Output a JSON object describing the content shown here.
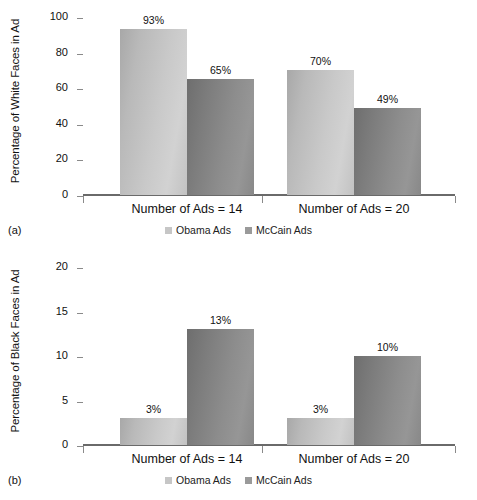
{
  "figure": {
    "panels": [
      {
        "caption": "(a)",
        "ylabel": "Percentage of White Faces in Ad",
        "yticks": [
          "0",
          "20",
          "40",
          "60",
          "80",
          "100"
        ],
        "groups": [
          {
            "label": "Number of Ads = 14",
            "bars": [
              {
                "series": "Obama Ads",
                "value": 93,
                "display": "93%"
              },
              {
                "series": "McCain Ads",
                "value": 65,
                "display": "65%"
              }
            ]
          },
          {
            "label": "Number of Ads = 20",
            "bars": [
              {
                "series": "Obama Ads",
                "value": 70,
                "display": "70%"
              },
              {
                "series": "McCain Ads",
                "value": 49,
                "display": "49%"
              }
            ]
          }
        ],
        "legend": [
          {
            "label": "Obama Ads"
          },
          {
            "label": "McCain Ads"
          }
        ]
      },
      {
        "caption": "(b)",
        "ylabel": "Percentage of Black Faces in Ad",
        "yticks": [
          "0",
          "5",
          "10",
          "15",
          "20"
        ],
        "groups": [
          {
            "label": "Number of Ads = 14",
            "bars": [
              {
                "series": "Obama Ads",
                "value": 3,
                "display": "3%"
              },
              {
                "series": "McCain Ads",
                "value": 13,
                "display": "13%"
              }
            ]
          },
          {
            "label": "Number of Ads = 20",
            "bars": [
              {
                "series": "Obama Ads",
                "value": 3,
                "display": "3%"
              },
              {
                "series": "McCain Ads",
                "value": 10,
                "display": "10%"
              }
            ]
          }
        ],
        "legend": [
          {
            "label": "Obama Ads"
          },
          {
            "label": "McCain Ads"
          }
        ]
      }
    ]
  },
  "colors": {
    "obama": "#c9c9c9",
    "mccain": "#8d8d8d",
    "axis": "#6a6a6a",
    "text": "#111111",
    "background": "#ffffff"
  },
  "chart_data": [
    {
      "type": "bar",
      "title": "",
      "subtitle": "(a)",
      "xlabel": "",
      "ylabel": "Percentage of White Faces in Ad",
      "categories": [
        "Number of Ads = 14",
        "Number of Ads = 20"
      ],
      "series": [
        {
          "name": "Obama Ads",
          "values": [
            93,
            70
          ]
        },
        {
          "name": "McCain Ads",
          "values": [
            65,
            49
          ]
        }
      ],
      "data_labels": [
        [
          "93%",
          "70%"
        ],
        [
          "65%",
          "49%"
        ]
      ],
      "ylim": [
        0,
        100
      ],
      "yticks": [
        0,
        20,
        40,
        60,
        80,
        100
      ],
      "grid": false,
      "legend_position": "bottom"
    },
    {
      "type": "bar",
      "title": "",
      "subtitle": "(b)",
      "xlabel": "",
      "ylabel": "Percentage of Black Faces in Ad",
      "categories": [
        "Number of Ads = 14",
        "Number of Ads = 20"
      ],
      "series": [
        {
          "name": "Obama Ads",
          "values": [
            3,
            3
          ]
        },
        {
          "name": "McCain Ads",
          "values": [
            13,
            10
          ]
        }
      ],
      "data_labels": [
        [
          "3%",
          "3%"
        ],
        [
          "13%",
          "10%"
        ]
      ],
      "ylim": [
        0,
        20
      ],
      "yticks": [
        0,
        5,
        10,
        15,
        20
      ],
      "grid": false,
      "legend_position": "bottom"
    }
  ]
}
